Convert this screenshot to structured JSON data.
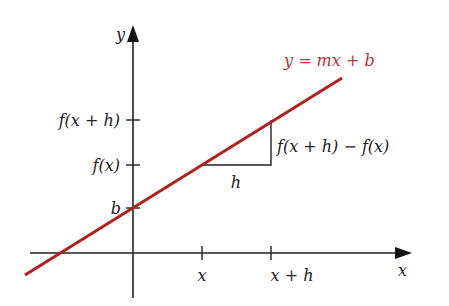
{
  "diagram": {
    "colors": {
      "line": "#b0201f",
      "axis": "#222222",
      "equation_text": "#b03a3a"
    },
    "axes": {
      "x_label": "x",
      "y_label": "y"
    },
    "line_equation": "y = mx + b",
    "y_ticks": [
      {
        "label": "f(x + h)",
        "y": 120
      },
      {
        "label": "f(x)",
        "y": 165
      },
      {
        "label": "b",
        "y": 208
      }
    ],
    "x_ticks": [
      {
        "label": "x",
        "x": 202
      },
      {
        "label": "x + h",
        "x": 271
      }
    ],
    "triangle": {
      "run_label": "h",
      "rise_label": "f(x + h) − f(x)"
    }
  }
}
